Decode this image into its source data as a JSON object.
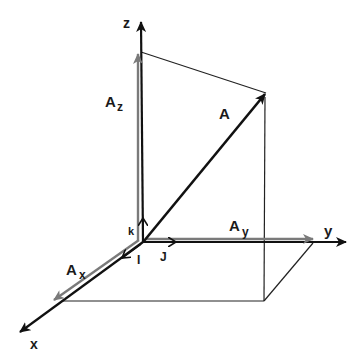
{
  "diagram": {
    "axes": {
      "x": "x",
      "y": "y",
      "z": "z"
    },
    "vector": {
      "name": "A"
    },
    "components": {
      "ax": {
        "base": "A",
        "sub": "x"
      },
      "ay": {
        "base": "A",
        "sub": "y"
      },
      "az": {
        "base": "A",
        "sub": "z"
      }
    },
    "unit_vectors": {
      "i": "I",
      "j": "J",
      "k": "k"
    },
    "colors": {
      "axis": "#111111",
      "component": "#7a7a7a",
      "guide": "#222222"
    }
  }
}
